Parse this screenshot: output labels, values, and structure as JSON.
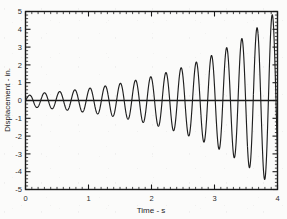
{
  "figure": {
    "background_color": "#fbfbfa",
    "line_color": "#1f1f1f",
    "axis_color": "#1a1a1a"
  },
  "chart_data": {
    "type": "line",
    "title": "",
    "subtitle": "",
    "xlabel": "Time - s",
    "ylabel": "Displacement - in.",
    "xlim": [
      0,
      4
    ],
    "ylim": [
      -5,
      5
    ],
    "x_major_ticks": [
      0,
      1,
      2,
      3,
      4
    ],
    "x_major_tick_labels": [
      "0",
      "1",
      "2",
      "3",
      "4"
    ],
    "x_minor_tick_step": 0.1,
    "y_major_ticks": [
      -5,
      -4,
      -3,
      -2,
      -1,
      0,
      1,
      2,
      3,
      4,
      5
    ],
    "y_major_tick_labels": [
      "-5",
      "-4",
      "-3",
      "-2",
      "-1",
      "0",
      "1",
      "2",
      "3",
      "4",
      "5"
    ],
    "y_minor_tick_step": 0.2,
    "grid": false,
    "legend": false,
    "legend_position": "none",
    "ticks_direction": "in",
    "frame": "box-all-four-sides",
    "zero_line": true,
    "annotations": [],
    "series": [
      {
        "name": "displacement",
        "description": "growing (unstable) sinusoidal oscillation, envelope expands from about 0.35 in. to about 4.7 in.",
        "model": "A0 * exp(growth * t) * sin(2*pi*f*t)",
        "amplitude_initial": 0.35,
        "growth_rate": 0.66,
        "frequency_hz": 4.15,
        "phase_rad": 0.0,
        "sample_step": 0.002,
        "envelope_points": [
          {
            "t": 0.12,
            "amp": 0.38
          },
          {
            "t": 0.36,
            "amp": 0.45
          },
          {
            "t": 0.6,
            "amp": 0.52
          },
          {
            "t": 0.84,
            "amp": 0.62
          },
          {
            "t": 1.08,
            "amp": 0.72
          },
          {
            "t": 1.32,
            "amp": 0.85
          },
          {
            "t": 1.56,
            "amp": 1.0
          },
          {
            "t": 1.8,
            "amp": 1.18
          },
          {
            "t": 2.04,
            "amp": 1.38
          },
          {
            "t": 2.28,
            "amp": 1.62
          },
          {
            "t": 2.52,
            "amp": 1.9
          },
          {
            "t": 2.76,
            "amp": 2.23
          },
          {
            "t": 3.0,
            "amp": 2.61
          },
          {
            "t": 3.24,
            "amp": 3.06
          },
          {
            "t": 3.48,
            "amp": 3.59
          },
          {
            "t": 3.72,
            "amp": 4.21
          },
          {
            "t": 3.88,
            "amp": 4.7
          }
        ],
        "peaks": [
          {
            "t": 0.06,
            "y": 0.37
          },
          {
            "t": 0.3,
            "y": 0.43
          },
          {
            "t": 0.54,
            "y": 0.5
          },
          {
            "t": 0.78,
            "y": 0.6
          },
          {
            "t": 1.02,
            "y": 0.7
          },
          {
            "t": 1.26,
            "y": 0.82
          },
          {
            "t": 1.5,
            "y": 0.97
          },
          {
            "t": 1.74,
            "y": 1.14
          },
          {
            "t": 1.98,
            "y": 1.34
          },
          {
            "t": 2.22,
            "y": 1.57
          },
          {
            "t": 2.46,
            "y": 1.85
          },
          {
            "t": 2.7,
            "y": 2.17
          },
          {
            "t": 2.94,
            "y": 2.55
          },
          {
            "t": 3.18,
            "y": 2.99
          },
          {
            "t": 3.42,
            "y": 3.51
          },
          {
            "t": 3.66,
            "y": 4.12
          },
          {
            "t": 3.86,
            "y": 4.7
          }
        ],
        "troughs": [
          {
            "t": 0.18,
            "y": -0.4
          },
          {
            "t": 0.42,
            "y": -0.46
          },
          {
            "t": 0.66,
            "y": -0.55
          },
          {
            "t": 0.9,
            "y": -0.65
          },
          {
            "t": 1.14,
            "y": -0.76
          },
          {
            "t": 1.38,
            "y": -0.89
          },
          {
            "t": 1.62,
            "y": -1.05
          },
          {
            "t": 1.86,
            "y": -1.23
          },
          {
            "t": 2.1,
            "y": -1.45
          },
          {
            "t": 2.34,
            "y": -1.7
          },
          {
            "t": 2.58,
            "y": -2.0
          },
          {
            "t": 2.82,
            "y": -2.34
          },
          {
            "t": 3.06,
            "y": -2.75
          },
          {
            "t": 3.3,
            "y": -3.23
          },
          {
            "t": 3.54,
            "y": -3.79
          },
          {
            "t": 3.78,
            "y": -4.45
          },
          {
            "t": 3.94,
            "y": -5.0
          }
        ]
      }
    ]
  }
}
